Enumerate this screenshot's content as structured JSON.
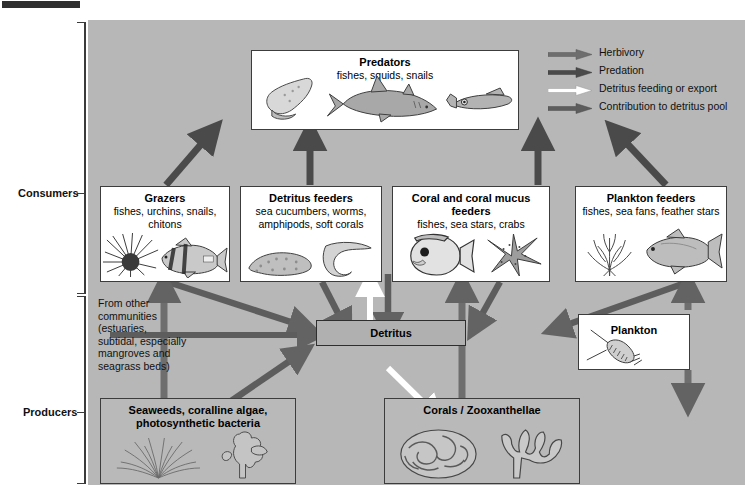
{
  "diagram": {
    "background_color": "#b7b7b7",
    "brackets": [
      {
        "label": "Consumers"
      },
      {
        "label": "Producers"
      }
    ],
    "legend": {
      "items": [
        {
          "label": "Herbivory",
          "color": "#6e6e6e",
          "icon": "arrow-right-icon"
        },
        {
          "label": "Predation",
          "color": "#4a4a4a",
          "icon": "arrow-right-icon"
        },
        {
          "label": "Detritus feeding or export",
          "color": "#ffffff",
          "icon": "arrow-right-icon"
        },
        {
          "label": "Contribution to detritus pool",
          "color": "#5d5d5d",
          "icon": "arrow-right-icon"
        }
      ]
    },
    "boxes": [
      {
        "id": "predators",
        "title": "Predators",
        "subtitle": "fishes, squids, snails",
        "organisms": [
          "conch-snail",
          "shark",
          "squid"
        ],
        "fill": "#ffffff"
      },
      {
        "id": "grazers",
        "title": "Grazers",
        "subtitle": "fishes, urchins, snails, chitons",
        "organisms": [
          "sea-urchin",
          "surgeonfish"
        ],
        "fill": "#ffffff"
      },
      {
        "id": "detritus_feeders",
        "title": "Detritus feeders",
        "subtitle": "sea cucumbers, worms, amphipods, soft corals",
        "organisms": [
          "sea-cucumber",
          "worm"
        ],
        "fill": "#ffffff"
      },
      {
        "id": "coral_feeders",
        "title": "Coral and coral mucus feeders",
        "subtitle": "fishes, sea stars, crabs",
        "organisms": [
          "butterflyfish",
          "sea-star"
        ],
        "fill": "#ffffff"
      },
      {
        "id": "plankton_feeders",
        "title": "Plankton feeders",
        "subtitle": "fishes, sea fans, feather stars",
        "organisms": [
          "sea-fan",
          "fish"
        ],
        "fill": "#ffffff"
      },
      {
        "id": "plankton",
        "title": "Plankton",
        "subtitle": "",
        "organisms": [
          "copepod"
        ],
        "fill": "#ffffff"
      },
      {
        "id": "detritus",
        "title": "Detritus",
        "subtitle": "",
        "organisms": [],
        "fill": "#b0b0b0"
      },
      {
        "id": "seaweeds",
        "title": "Seaweeds, coralline algae, photosynthetic bacteria",
        "title_line1": "Seaweeds, coralline algae,",
        "title_line2": "photosynthetic bacteria",
        "subtitle": "",
        "organisms": [
          "seaweed-tuft",
          "coralline-algae"
        ],
        "fill": "#b9b9b9"
      },
      {
        "id": "corals",
        "title": "Corals / Zooxanthellae",
        "subtitle": "",
        "organisms": [
          "brain-coral",
          "branching-coral"
        ],
        "fill": "#b9b9b9"
      }
    ],
    "notes": [
      {
        "id": "from_other_communities",
        "lines": [
          "From other",
          "communities",
          "(estuaries,",
          "subtidal, especially",
          "mangroves and",
          "seagrass beds)"
        ]
      }
    ],
    "flows": [
      {
        "from": "grazers",
        "to": "predators",
        "type": "Predation"
      },
      {
        "from": "detritus_feeders",
        "to": "predators",
        "type": "Predation"
      },
      {
        "from": "coral_feeders",
        "to": "predators",
        "type": "Predation"
      },
      {
        "from": "plankton_feeders",
        "to": "predators",
        "type": "Predation"
      },
      {
        "from": "predators",
        "to": "detritus",
        "type": "Contribution to detritus pool"
      },
      {
        "from": "grazers",
        "to": "detritus",
        "type": "Contribution to detritus pool"
      },
      {
        "from": "detritus_feeders",
        "to": "detritus",
        "type": "Contribution to detritus pool"
      },
      {
        "from": "coral_feeders",
        "to": "detritus",
        "type": "Contribution to detritus pool"
      },
      {
        "from": "plankton_feeders",
        "to": "detritus",
        "type": "Contribution to detritus pool"
      },
      {
        "from": "detritus",
        "to": "detritus_feeders",
        "type": "Detritus feeding or export"
      },
      {
        "from": "detritus",
        "to": "corals",
        "type": "Detritus feeding or export"
      },
      {
        "from": "from_other_communities",
        "to": "detritus",
        "type": "Detritus feeding or export"
      },
      {
        "from": "seaweeds",
        "to": "grazers",
        "type": "Herbivory"
      },
      {
        "from": "seaweeds",
        "to": "detritus",
        "type": "Contribution to detritus pool"
      },
      {
        "from": "corals",
        "to": "coral_feeders",
        "type": "Herbivory"
      },
      {
        "from": "corals",
        "to": "detritus",
        "type": "Contribution to detritus pool"
      },
      {
        "from": "plankton",
        "to": "plankton_feeders",
        "type": "Herbivory"
      },
      {
        "from": "plankton",
        "to": "corals",
        "type": "Herbivory"
      }
    ]
  }
}
